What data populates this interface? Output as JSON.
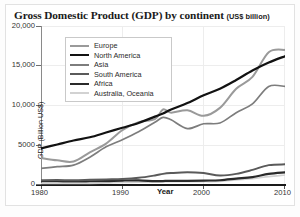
{
  "figure": {
    "title_main": "Gross Domestic Product (GDP) by continent",
    "title_unit": "(US$ billion)"
  },
  "legend": {
    "items": [
      {
        "label": "Europe",
        "color": "#9a9a9a",
        "width": 2.0
      },
      {
        "label": "North America",
        "color": "#121212",
        "width": 2.2
      },
      {
        "label": "Asia",
        "color": "#7d7d7d",
        "width": 1.7
      },
      {
        "label": "South America",
        "color": "#5a5a5a",
        "width": 2.0
      },
      {
        "label": "Africa",
        "color": "#2a2a2a",
        "width": 2.2
      },
      {
        "label": "Australia, Oceania",
        "color": "#d2d2d2",
        "width": 1.6
      }
    ]
  },
  "axes": {
    "ytitle": "GDP (Billion US$)",
    "xtitle": "Year",
    "yticks": [
      "20,000",
      "15,000",
      "10,000",
      "5000",
      "0"
    ],
    "xticks": [
      "1980",
      "1990",
      "2000",
      "2010"
    ]
  },
  "chart_data": {
    "type": "line",
    "title": "Gross Domestic Product (GDP) by continent (US$ billion)",
    "xlabel": "Year",
    "ylabel": "GDP (Billion US$)",
    "xlim": [
      1980,
      2010
    ],
    "ylim": [
      0,
      20000
    ],
    "yticks": [
      0,
      5000,
      10000,
      15000,
      20000
    ],
    "xticks": [
      1980,
      1990,
      2000,
      2010
    ],
    "grid": true,
    "legend_position": "upper-left-inside",
    "x": [
      1980,
      1982,
      1984,
      1986,
      1988,
      1990,
      1992,
      1994,
      1995,
      1996,
      1998,
      2000,
      2002,
      2004,
      2006,
      2008,
      2010
    ],
    "series": [
      {
        "name": "Europe",
        "color": "#9a9a9a",
        "values": [
          3400,
          3100,
          2950,
          4100,
          5200,
          6900,
          7900,
          8300,
          9500,
          9100,
          9400,
          8700,
          9700,
          12100,
          13600,
          16700,
          17000
        ]
      },
      {
        "name": "North America",
        "color": "#121212",
        "values": [
          4600,
          5100,
          5600,
          6000,
          6600,
          7200,
          7800,
          8600,
          9000,
          9500,
          10300,
          11300,
          12100,
          13200,
          14400,
          15400,
          16200
        ]
      },
      {
        "name": "Asia",
        "color": "#7d7d7d",
        "values": [
          2100,
          2300,
          2500,
          3500,
          4800,
          5700,
          6700,
          7900,
          8500,
          8200,
          7100,
          7700,
          7800,
          9100,
          10200,
          12400,
          12400
        ]
      },
      {
        "name": "South America",
        "color": "#5a5a5a",
        "values": [
          600,
          620,
          600,
          650,
          700,
          750,
          900,
          1200,
          1400,
          1500,
          1600,
          1500,
          1200,
          1400,
          1900,
          2500,
          2600
        ]
      },
      {
        "name": "Africa",
        "color": "#2a2a2a",
        "values": [
          500,
          480,
          450,
          470,
          500,
          560,
          580,
          480,
          500,
          520,
          520,
          560,
          600,
          800,
          1000,
          1400,
          1600
        ]
      },
      {
        "name": "Australia, Oceania",
        "color": "#d2d2d2",
        "values": [
          180,
          190,
          190,
          200,
          250,
          320,
          340,
          380,
          400,
          420,
          420,
          430,
          450,
          640,
          800,
          1050,
          1250
        ]
      }
    ]
  }
}
